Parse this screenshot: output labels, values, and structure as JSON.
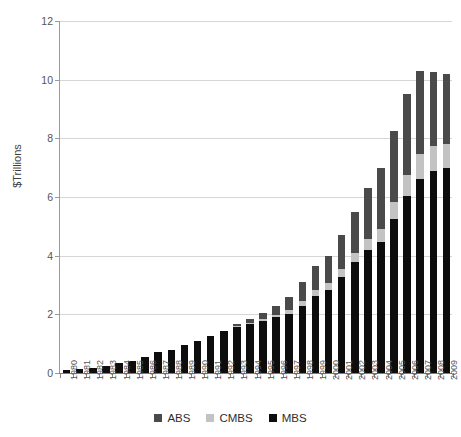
{
  "chart_data": {
    "type": "bar",
    "subtype": "stacked-vertical",
    "title": "",
    "xlabel": "",
    "ylabel": "$Trillions",
    "ylim": [
      0,
      12
    ],
    "y_ticks": [
      0,
      2,
      4,
      6,
      8,
      10,
      12
    ],
    "y_tick_labels": [
      "0",
      "2",
      "4",
      "6",
      "8",
      "10",
      "12"
    ],
    "grid": "horizontal",
    "legend_position": "bottom",
    "stack_order_bottom_to_top": [
      "MBS",
      "CMBS",
      "ABS"
    ],
    "categories": [
      "1980",
      "1981",
      "1982",
      "1983",
      "1984",
      "1985",
      "1986",
      "1987",
      "1988",
      "1989",
      "1990",
      "1991",
      "1992",
      "1993",
      "1994",
      "1995",
      "1996",
      "1997",
      "1998",
      "1999",
      "2000",
      "2001",
      "2002",
      "2003",
      "2004",
      "2005",
      "2006",
      "2007",
      "2008",
      "2009"
    ],
    "series": [
      {
        "name": "MBS",
        "color": "#0d0d0d",
        "values": [
          0.11,
          0.13,
          0.18,
          0.25,
          0.33,
          0.42,
          0.56,
          0.72,
          0.8,
          0.95,
          1.08,
          1.25,
          1.42,
          1.57,
          1.68,
          1.78,
          1.9,
          2.02,
          2.28,
          2.62,
          2.82,
          3.28,
          3.78,
          4.18,
          4.45,
          5.25,
          6.03,
          6.62,
          6.9,
          7.0
        ]
      },
      {
        "name": "CMBS",
        "color": "#c3c3c3",
        "values": [
          0.0,
          0.0,
          0.0,
          0.0,
          0.0,
          0.0,
          0.0,
          0.0,
          0.0,
          0.0,
          0.0,
          0.0,
          0.0,
          0.02,
          0.03,
          0.05,
          0.08,
          0.12,
          0.17,
          0.21,
          0.24,
          0.28,
          0.32,
          0.38,
          0.47,
          0.58,
          0.72,
          0.85,
          0.85,
          0.82
        ]
      },
      {
        "name": "ABS",
        "color": "#4a4a4a",
        "values": [
          0.0,
          0.0,
          0.0,
          0.0,
          0.0,
          0.0,
          0.0,
          0.0,
          0.0,
          0.0,
          0.0,
          0.0,
          0.02,
          0.06,
          0.12,
          0.22,
          0.32,
          0.46,
          0.65,
          0.82,
          0.94,
          1.14,
          1.4,
          1.74,
          2.08,
          2.42,
          2.75,
          2.82,
          2.52,
          2.38
        ]
      }
    ],
    "totals": [
      0.11,
      0.13,
      0.18,
      0.25,
      0.33,
      0.42,
      0.56,
      0.72,
      0.8,
      0.95,
      1.08,
      1.25,
      1.44,
      1.65,
      1.83,
      2.05,
      2.3,
      2.6,
      3.1,
      3.65,
      4.0,
      4.7,
      5.5,
      6.3,
      7.0,
      8.25,
      9.5,
      10.29,
      10.27,
      10.2
    ]
  },
  "legend": {
    "items": [
      {
        "label": "ABS",
        "color": "#4a4a4a"
      },
      {
        "label": "CMBS",
        "color": "#c3c3c3"
      },
      {
        "label": "MBS",
        "color": "#0d0d0d"
      }
    ]
  }
}
